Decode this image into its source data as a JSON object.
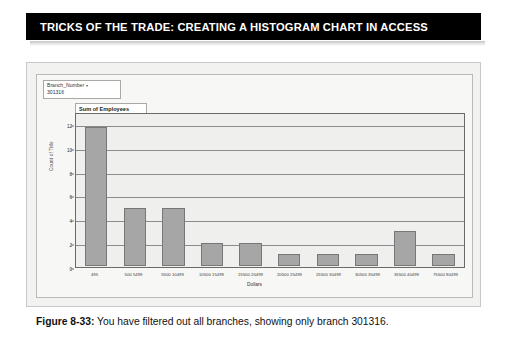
{
  "banner": {
    "title": "TRICKS OF THE TRADE: CREATING A HISTOGRAM CHART IN ACCESS"
  },
  "chart_panel": {
    "filter": {
      "field_label": "Branch_Number",
      "dropdown_icon": "chevron-down-icon",
      "selected_value": "301316"
    },
    "series_title": "Sum of Employees"
  },
  "caption": {
    "figure_number": "Figure 8-33:",
    "text": " You have filtered out all branches, showing only branch 301316."
  },
  "chart_data": {
    "type": "bar",
    "title": "Sum of Employees",
    "xlabel": "Dollars",
    "ylabel": "Count of Title",
    "ylim": [
      0,
      13
    ],
    "yticks": [
      "0",
      "2",
      "4",
      "6",
      "8",
      "10",
      "12"
    ],
    "ytick_values": [
      0,
      2,
      4,
      6,
      8,
      10,
      12
    ],
    "grid": true,
    "legend_position": "top-left",
    "categories": [
      "495",
      "500  5499",
      "5500  10499",
      "10500  15499",
      "15500  20499",
      "20500  25499",
      "25500  30499",
      "30500  35499",
      "35500  40499",
      "75500  80499"
    ],
    "values": [
      12,
      5,
      5,
      2,
      2,
      1,
      1,
      1,
      3,
      1
    ],
    "series": [
      {
        "name": "Sum of Employees",
        "values": [
          12,
          5,
          5,
          2,
          2,
          1,
          1,
          1,
          3,
          1
        ]
      }
    ],
    "bar_color": "#a6a6a6",
    "bar_border_color": "#777777",
    "plot_background": "#efefed"
  }
}
